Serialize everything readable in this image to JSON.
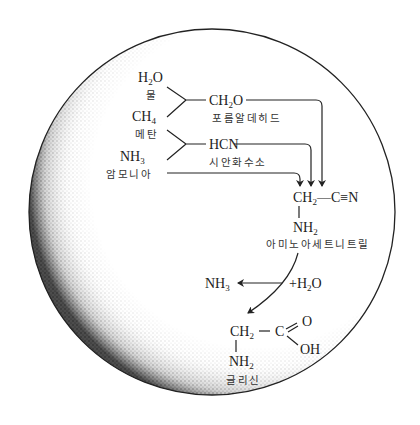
{
  "diagram": {
    "colors": {
      "ink": "#222222",
      "background": "#ffffff",
      "stipple": "#333333"
    },
    "reactants": [
      {
        "formula": "H",
        "sub": "2",
        "rest": "O",
        "label": "물"
      },
      {
        "formula": "CH",
        "sub": "4",
        "rest": "",
        "label": "메탄"
      },
      {
        "formula": "NH",
        "sub": "3",
        "rest": "",
        "label": "암모니아"
      }
    ],
    "intermediates": [
      {
        "formula": "CH",
        "sub": "2",
        "rest": "O",
        "label": "포름알데히드"
      },
      {
        "formula": "HCN",
        "label": "시안화수소"
      }
    ],
    "aminoacetonitrile": {
      "formula_left": "CH",
      "formula_left_sub": "2",
      "formula_right": "—C≡N",
      "amine": "NH",
      "amine_sub": "2",
      "label": "아미노아세트니트릴"
    },
    "hydrolysis": {
      "reagent": "+H",
      "reagent_sub": "2",
      "reagent_rest": "O",
      "byproduct": "NH",
      "byproduct_sub": "3"
    },
    "glycine": {
      "ch2": "CH",
      "ch2_sub": "2",
      "dash": "—",
      "c": "C",
      "o": "O",
      "oh": "OH",
      "amine": "NH",
      "amine_sub": "2",
      "label": "글리신"
    }
  }
}
